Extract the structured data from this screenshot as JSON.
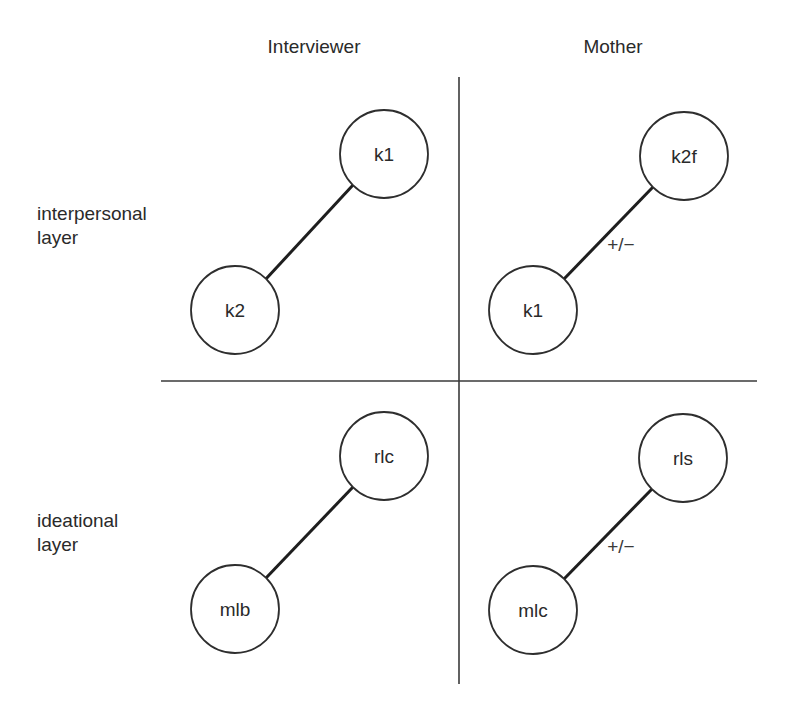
{
  "columns": {
    "left": "Interviewer",
    "right": "Mother"
  },
  "rows": {
    "top": {
      "line1": "interpersonal",
      "line2": "layer"
    },
    "bottom": {
      "line1": "ideational",
      "line2": "layer"
    }
  },
  "quadrants": {
    "interviewer_interpersonal": {
      "upper_node": "k1",
      "lower_node": "k2",
      "edge_label": ""
    },
    "mother_interpersonal": {
      "upper_node": "k2f",
      "lower_node": "k1",
      "edge_label": "+/−"
    },
    "interviewer_ideational": {
      "upper_node": "rlc",
      "lower_node": "mlb",
      "edge_label": ""
    },
    "mother_ideational": {
      "upper_node": "rls",
      "lower_node": "mlc",
      "edge_label": "+/−"
    }
  }
}
